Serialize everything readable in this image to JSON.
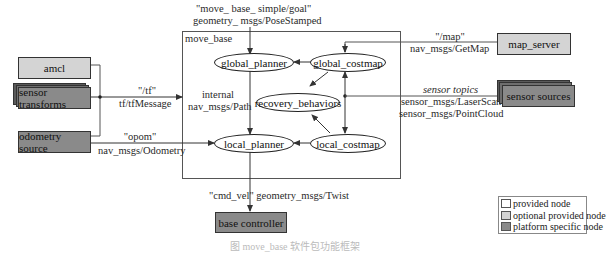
{
  "diagram": {
    "container": {
      "label": "move_base"
    },
    "top_input": {
      "topic": "\"move_ base_ simple/goal\"",
      "type": "geometry_ msgs/PoseStamped"
    },
    "internal_nodes": {
      "global_planner": "global_planner",
      "global_costmap": "global_costmap",
      "recovery_behaviors": "recovery_behaviors",
      "local_planner": "local_planner",
      "local_costmap": "local_costmap"
    },
    "internal_path_label": {
      "line1": "internal",
      "line2": "nav_msgs/Path"
    },
    "external_nodes": {
      "amcl": {
        "label": "amcl",
        "kind": "optional provided node"
      },
      "sensor_transforms": {
        "label": "sensor transforms",
        "kind": "platform specific node"
      },
      "odometry_source": {
        "label": "odometry source",
        "kind": "platform specific node"
      },
      "map_server": {
        "label": "map_server",
        "kind": "optional provided node"
      },
      "sensor_sources": {
        "label": "sensor sources",
        "kind": "platform specific node"
      },
      "base_controller": {
        "label": "base controller",
        "kind": "platform specific node"
      }
    },
    "edges": {
      "tf": {
        "topic": "\"/tf\"",
        "type": "tf/tfMessage"
      },
      "odom": {
        "topic": "\"opom\"",
        "type": "nav_msgs/Odometry"
      },
      "map": {
        "topic": "\"/map\"",
        "type": "nav_msgs/GetMap"
      },
      "sensors": {
        "topic": "sensor topics",
        "type1": "sensor_msgs/LaserScan",
        "type2": "sensor_msgs/PointCloud"
      },
      "cmd_vel": {
        "label": "\"cmd_vel\" geometry_msgs/Twist"
      }
    },
    "legend": {
      "items": [
        {
          "label": "provided node",
          "color": "#ffffff"
        },
        {
          "label": "optional provided node",
          "color": "#d4d4d4"
        },
        {
          "label": "platform specific node",
          "color": "#8a8a8a"
        }
      ]
    },
    "caption": "图 move_base 软件包功能框架"
  },
  "colors": {
    "optional_fill": "#d4d4d4",
    "platform_fill": "#8a8a8a",
    "stack_shadow": "#5a5a5a",
    "line": "#333333"
  }
}
